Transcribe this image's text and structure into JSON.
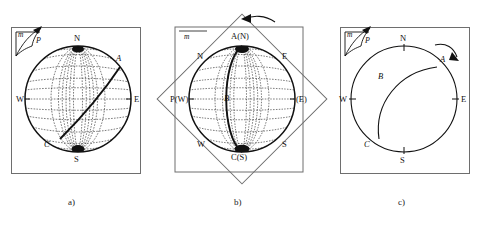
{
  "figure": {
    "background": "#ffffff",
    "ink": "#111111",
    "frame_color": "#6e6e6e"
  },
  "panels": [
    {
      "id": "a",
      "caption": "a)",
      "corner_marker": {
        "m_label": "m",
        "p_label": "P"
      },
      "net": {
        "type": "equal-area-stereonet",
        "grid_interval_deg": 10,
        "cardinal_labels": [
          "N",
          "E",
          "S",
          "W"
        ],
        "point_labels": [
          "A",
          "C"
        ],
        "great_circle": {
          "from": "A",
          "to": "C",
          "orientation": "NE-SW diagonal"
        }
      },
      "labels": {
        "north": "N",
        "east": "E",
        "south": "S",
        "west": "W",
        "point_a": "A",
        "point_c": "C"
      }
    },
    {
      "id": "b",
      "caption": "b)",
      "corner_marker": {
        "m_label": "m"
      },
      "rotation_arrow": {
        "direction": "counterclockwise",
        "glyph": "curved-arrow-left"
      },
      "overlay": {
        "square_rotation_deg": 45,
        "description": "tracing paper rotated 45 degrees"
      },
      "net": {
        "type": "equal-area-stereonet",
        "grid_interval_deg": 10,
        "great_circle": {
          "from": "A(N)",
          "to": "C(S)",
          "orientation": "vertical N-S"
        }
      },
      "labels": {
        "top": "A(N)",
        "bottom": "C(S)",
        "left": "P(W)",
        "right": "(E)",
        "inner_north": "N",
        "inner_east": "E",
        "inner_south": "S",
        "inner_west": "W",
        "center": "B"
      }
    },
    {
      "id": "c",
      "caption": "c)",
      "corner_marker": {
        "m_label": "m",
        "p_label": "P"
      },
      "rotation_arrow": {
        "direction": "clockwise",
        "glyph": "curved-arrow-right"
      },
      "net": {
        "type": "primitive-circle-only",
        "tick_marks": [
          "N",
          "E",
          "S",
          "W"
        ],
        "great_circle": {
          "from": "A",
          "through": "B",
          "to": "C"
        }
      },
      "labels": {
        "north": "N",
        "east": "E",
        "south": "S",
        "west": "W",
        "point_a": "A",
        "point_b": "B",
        "point_c": "C"
      }
    }
  ]
}
